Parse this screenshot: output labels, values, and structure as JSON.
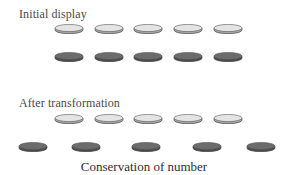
{
  "figure": {
    "initial_label": "Initial display",
    "after_label": "After transformation",
    "caption": "Conservation of number"
  },
  "colors": {
    "light_coin_top": "#e4e4e4",
    "light_coin_edge": "#a8a8a8",
    "dark_coin_top": "#6c6c6c",
    "dark_coin_edge": "#4a4a4a"
  },
  "rows": {
    "initial_light": {
      "count": 5,
      "y": 24,
      "x": [
        54,
        94,
        133,
        173,
        213
      ]
    },
    "initial_dark": {
      "count": 5,
      "y": 52,
      "x": [
        54,
        94,
        133,
        173,
        213
      ]
    },
    "after_light": {
      "count": 5,
      "y": 114,
      "x": [
        54,
        94,
        133,
        173,
        213
      ]
    },
    "after_dark": {
      "count": 5,
      "y": 142,
      "x": [
        18,
        71,
        131,
        192,
        246
      ]
    }
  }
}
